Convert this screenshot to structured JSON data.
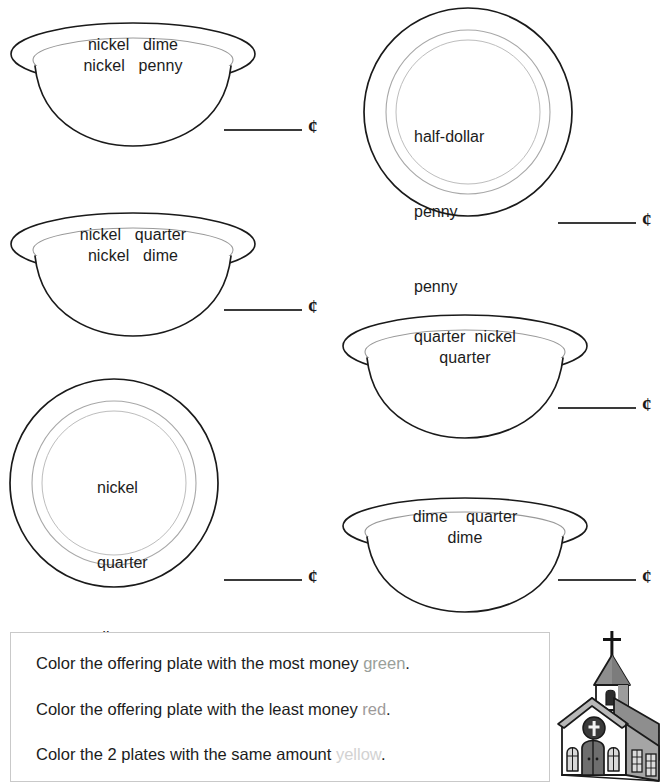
{
  "worksheet": {
    "title": "Offering Plate Money Counting Worksheet",
    "cent_symbol": "¢",
    "blank_placeholder": ""
  },
  "plates": [
    {
      "id": "plate-1",
      "shape": "bowl",
      "coins_lines": [
        "nickel   dime",
        "nickel   penny"
      ],
      "coins": [
        "nickel",
        "dime",
        "nickel",
        "penny"
      ],
      "answer": ""
    },
    {
      "id": "plate-2",
      "shape": "round",
      "coins_lines": [
        "half-dollar",
        "penny",
        "penny",
        "penny"
      ],
      "coins": [
        "half-dollar",
        "penny",
        "penny",
        "penny"
      ],
      "answer": ""
    },
    {
      "id": "plate-3",
      "shape": "bowl",
      "coins_lines": [
        "nickel   quarter",
        "nickel   dime"
      ],
      "coins": [
        "nickel",
        "quarter",
        "nickel",
        "dime"
      ],
      "answer": ""
    },
    {
      "id": "plate-4",
      "shape": "bowl",
      "coins_lines": [
        "quarter  nickel",
        "quarter"
      ],
      "coins": [
        "quarter",
        "nickel",
        "quarter"
      ],
      "answer": ""
    },
    {
      "id": "plate-5",
      "shape": "round",
      "coins_lines": [
        "nickel",
        "quarter",
        "dime",
        "penny"
      ],
      "coins": [
        "nickel",
        "quarter",
        "dime",
        "penny"
      ],
      "answer": ""
    },
    {
      "id": "plate-6",
      "shape": "bowl",
      "coins_lines": [
        "dime    quarter",
        "dime"
      ],
      "coins": [
        "dime",
        "quarter",
        "dime"
      ],
      "answer": ""
    }
  ],
  "instructions": {
    "lines": [
      {
        "prefix": "Color the offering plate with the most money ",
        "color_word": "green",
        "suffix": "."
      },
      {
        "prefix": "Color the offering plate with the least money ",
        "color_word": "red",
        "suffix": "."
      },
      {
        "prefix": "Color the 2 plates with the same amount ",
        "color_word": "yellow",
        "suffix": "."
      }
    ]
  },
  "church": {
    "label": "church illustration",
    "roof_color": "#9a9a9a",
    "wall_color": "#ffffff",
    "outline_color": "#1a1a1a",
    "door_color": "#767676",
    "window_color": "#d8d8d8"
  }
}
